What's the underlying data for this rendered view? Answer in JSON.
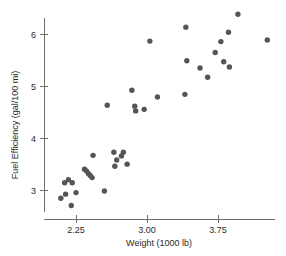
{
  "chart_data": {
    "type": "scatter",
    "title": "",
    "xlabel": "Weight (1000 lb)",
    "ylabel": "Fuel Efficiency (gal/100 mi)",
    "xticks": [
      "2.25",
      "3.00",
      "3.75"
    ],
    "xtick_values": [
      2.25,
      3.0,
      3.75
    ],
    "yticks": [
      "3",
      "4",
      "5",
      "6"
    ],
    "ytick_values": [
      3,
      4,
      5,
      6
    ],
    "xlim": [
      1.92,
      4.35
    ],
    "ylim": [
      2.55,
      6.55
    ],
    "grid": false,
    "legend": null,
    "marker_color": "#555555",
    "axis_color": "#6f6f6f",
    "series": [
      {
        "name": "Cars",
        "points": [
          [
            2.09,
            2.84
          ],
          [
            2.13,
            3.14
          ],
          [
            2.17,
            3.2
          ],
          [
            2.21,
            3.14
          ],
          [
            2.14,
            2.92
          ],
          [
            2.25,
            2.95
          ],
          [
            2.2,
            2.7
          ],
          [
            2.34,
            3.4
          ],
          [
            2.36,
            3.37
          ],
          [
            2.38,
            3.32
          ],
          [
            2.4,
            3.28
          ],
          [
            2.42,
            3.24
          ],
          [
            2.43,
            3.67
          ],
          [
            2.55,
            2.98
          ],
          [
            2.58,
            4.64
          ],
          [
            2.65,
            3.73
          ],
          [
            2.68,
            3.58
          ],
          [
            2.66,
            3.46
          ],
          [
            2.73,
            3.66
          ],
          [
            2.75,
            3.73
          ],
          [
            2.79,
            3.5
          ],
          [
            2.84,
            4.93
          ],
          [
            2.87,
            4.62
          ],
          [
            2.88,
            4.53
          ],
          [
            2.97,
            4.56
          ],
          [
            3.03,
            5.88
          ],
          [
            3.11,
            4.8
          ],
          [
            3.4,
            4.85
          ],
          [
            3.41,
            6.15
          ],
          [
            3.42,
            5.5
          ],
          [
            3.56,
            5.36
          ],
          [
            3.64,
            5.18
          ],
          [
            3.72,
            5.66
          ],
          [
            3.78,
            5.87
          ],
          [
            3.81,
            5.48
          ],
          [
            3.86,
            6.05
          ],
          [
            3.87,
            5.38
          ],
          [
            3.96,
            6.4
          ],
          [
            4.27,
            5.9
          ]
        ]
      }
    ]
  }
}
